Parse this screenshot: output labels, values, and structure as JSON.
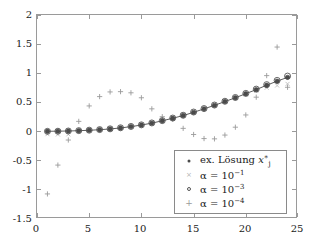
{
  "chart_data": {
    "type": "scatter",
    "title": "",
    "xlabel": "",
    "ylabel": "",
    "xlim": [
      0,
      25
    ],
    "ylim": [
      -1.5,
      2
    ],
    "grid": false,
    "legend_position": "lower-right",
    "xticks": [
      "0",
      "5",
      "10",
      "15",
      "20",
      "25"
    ],
    "xtick_values": [
      0,
      5,
      10,
      15,
      20,
      25
    ],
    "yticks": [
      "2",
      "1.5",
      "1",
      "0.5",
      "0",
      "-0.5",
      "-1",
      "-1.5"
    ],
    "ytick_values": [
      2,
      1.5,
      1,
      0.5,
      0,
      -0.5,
      -1,
      -1.5
    ],
    "x": [
      1,
      2,
      3,
      4,
      5,
      6,
      7,
      8,
      9,
      10,
      11,
      12,
      13,
      14,
      15,
      16,
      17,
      18,
      19,
      20,
      21,
      22,
      23,
      24
    ],
    "series": [
      {
        "name": "ex. Lösung x*_j",
        "marker": "dot",
        "color": "#4a4a4a",
        "line": true,
        "values": [
          0.005,
          0.007,
          0.01,
          0.015,
          0.022,
          0.032,
          0.045,
          0.062,
          0.085,
          0.112,
          0.145,
          0.185,
          0.228,
          0.275,
          0.33,
          0.39,
          0.45,
          0.515,
          0.58,
          0.65,
          0.72,
          0.795,
          0.865,
          0.93
        ]
      },
      {
        "name": "alpha = 10^-1",
        "marker": "x",
        "color": "#bdbdbd",
        "line": false,
        "values": [
          -0.045,
          -0.05,
          -0.048,
          0.01,
          0.028,
          0.04,
          0.05,
          0.068,
          0.092,
          0.118,
          0.15,
          0.192,
          0.238,
          0.29,
          0.345,
          0.4,
          0.462,
          0.52,
          0.58,
          0.64,
          0.7,
          0.752,
          0.79,
          0.818
        ]
      },
      {
        "name": "alpha = 10^-3",
        "marker": "o",
        "color": "#555555",
        "line": false,
        "values": [
          0.004,
          0.006,
          0.01,
          0.016,
          0.024,
          0.034,
          0.047,
          0.065,
          0.088,
          0.115,
          0.148,
          0.188,
          0.232,
          0.28,
          0.335,
          0.395,
          0.455,
          0.52,
          0.585,
          0.655,
          0.728,
          0.805,
          0.878,
          0.952
        ]
      },
      {
        "name": "alpha = 10^-4",
        "marker": "plus",
        "color": "#9a9a9a",
        "line": false,
        "values": [
          -1.07,
          -0.575,
          -0.145,
          0.175,
          0.44,
          0.6,
          0.68,
          0.685,
          0.665,
          0.58,
          0.39,
          0.255,
          0.215,
          0.055,
          -0.05,
          -0.12,
          -0.125,
          -0.06,
          0.075,
          0.285,
          0.59,
          0.96,
          1.45,
          0.76
        ]
      }
    ],
    "legend": [
      {
        "marker": "dot",
        "label_plain": "ex. Lösung x*_j",
        "prefix": "ex. Lösung ",
        "symbol": "x"
      },
      {
        "marker": "x",
        "label_plain": "α = 10^-1",
        "base": "α = 10",
        "exponent": "−1"
      },
      {
        "marker": "o",
        "label_plain": "α = 10^-3",
        "base": "α = 10",
        "exponent": "−3"
      },
      {
        "marker": "plus",
        "label_plain": "α = 10^-4",
        "base": "α = 10",
        "exponent": "−4"
      }
    ],
    "colors": {
      "axis": "#9a9a9a",
      "exact": "#4a4a4a",
      "alpha1": "#bdbdbd",
      "alpha3": "#555555",
      "alpha4": "#9a9a9a",
      "background": "#ffffff",
      "text": "#1a1a1a"
    }
  }
}
